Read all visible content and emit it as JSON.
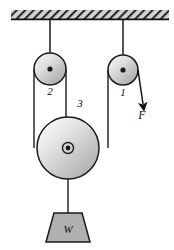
{
  "figure": {
    "type": "physics-free-body-diagram",
    "background_color": "#ffffff",
    "line_color": "#1a1a1a",
    "fill_color": "#b3b3b3",
    "ceiling": {
      "name": "hatched-ceiling-support",
      "x": 11,
      "y": 10,
      "width": 158,
      "height": 9,
      "hatch_label": "diagonal-hatching",
      "bar_color": "#cccccc",
      "edge_color": "#111111"
    },
    "pulleys": [
      {
        "id": "pulley-2",
        "label": "2",
        "cx": 50,
        "cy": 69,
        "r": 16,
        "label_x": 50,
        "label_y": 95,
        "hub": "solid-dot",
        "hub_r": 2.6
      },
      {
        "id": "pulley-1",
        "label": "1",
        "cx": 123,
        "cy": 70,
        "r": 15,
        "label_x": 123,
        "label_y": 96,
        "hub": "solid-dot",
        "hub_r": 2.6
      },
      {
        "id": "pulley-3",
        "label": "3",
        "cx": 68,
        "cy": 148,
        "r": 31,
        "label_x": 80,
        "label_y": 107,
        "hub": "ringed-dot",
        "hub_r": 2.4,
        "hub_ring_r": 5.5
      }
    ],
    "supports": [
      {
        "id": "support-line-pulley-2",
        "x": 50,
        "y1": 19,
        "y2": 69
      },
      {
        "id": "support-line-pulley-1",
        "x": 123,
        "y1": 19,
        "y2": 70
      }
    ],
    "ropes": [
      {
        "id": "rope-left-outer",
        "x": 34,
        "y1": 69,
        "y2": 148
      },
      {
        "id": "rope-left-inner",
        "x": 66,
        "y1": 69,
        "y2": 148
      },
      {
        "id": "rope-right-inner",
        "x": 108,
        "y1": 70,
        "y2": 148
      },
      {
        "id": "rope-pulley3-to-weight",
        "x": 68,
        "y1": 148,
        "y2": 213
      }
    ],
    "force": {
      "id": "force-arrow-F",
      "label": "F",
      "x1": 138,
      "y1": 70,
      "x2": 143,
      "y2": 104,
      "label_x": 142,
      "label_y": 119
    },
    "weight": {
      "id": "weight-block",
      "label": "W",
      "top_y": 213,
      "bottom_y": 242,
      "top_half_width": 14,
      "bottom_half_width": 22,
      "center_x": 68,
      "label_x": 68,
      "label_y": 233
    }
  }
}
